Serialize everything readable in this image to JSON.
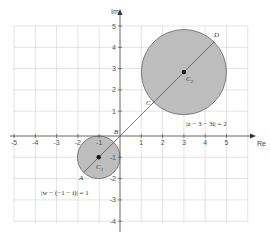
{
  "diagram": {
    "type": "complex-plane",
    "axes": {
      "x_label": "Re",
      "y_label": "Im",
      "x_ticks": [
        "-5",
        "-4",
        "-3",
        "-2",
        "-1",
        "1",
        "2",
        "3",
        "4",
        "5"
      ],
      "y_ticks": [
        "5",
        "4",
        "3",
        "2",
        "1",
        "-1",
        "-2",
        "-3",
        "-4"
      ],
      "x_range": [
        -5,
        6
      ],
      "y_range": [
        -4,
        5
      ]
    },
    "circles": [
      {
        "name": "C1",
        "center": [
          -1,
          -1
        ],
        "radius": 1,
        "equation": "|w − (−1 − i)| = 1",
        "center_label": "C",
        "center_sub": "1",
        "fill": "#bdbdbd"
      },
      {
        "name": "C2",
        "center": [
          3,
          3
        ],
        "radius": 2,
        "equation": "|z − 3 − 3i| = 2",
        "center_label": "C",
        "center_sub": "2",
        "fill": "#bdbdbd"
      }
    ],
    "points": [
      {
        "label": "A",
        "note": "far point of C1 on line"
      },
      {
        "label": "B",
        "note": "near point of C1 on line"
      },
      {
        "label": "C",
        "note": "near point of C2 on line"
      },
      {
        "label": "D",
        "note": "far point of C2 on line"
      }
    ],
    "line": {
      "description": "line y = x through both centers",
      "color": "#555555"
    },
    "colors": {
      "grid": "#d9d9d9",
      "axis": "#555555",
      "circle_fill": "#bdbdbd",
      "circle_stroke": "#666666"
    }
  }
}
